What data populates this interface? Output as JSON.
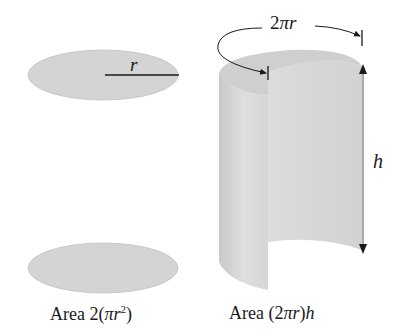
{
  "figure": {
    "left_panel": {
      "radius_label": "r",
      "caption_prefix": "Area 2(",
      "caption_pi": "π",
      "caption_r": "r",
      "caption_exp": "2",
      "caption_suffix": ")"
    },
    "right_panel": {
      "circumference_label_num": "2",
      "circumference_label_pi": "π",
      "circumference_label_r": "r",
      "height_label": "h",
      "caption_prefix": "Area (2",
      "caption_pi": "π",
      "caption_r": "r",
      "caption_close": ")",
      "caption_h": "h"
    },
    "colors": {
      "disk_fill": "#d4d4d4",
      "surface_fill": "#d9d9d9",
      "surface_shadow": "#c6c6c6",
      "line": "#1a1a1a"
    }
  }
}
